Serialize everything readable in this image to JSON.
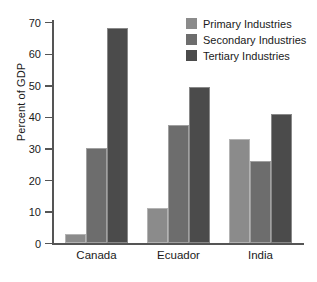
{
  "chart_data": {
    "type": "bar",
    "title": "",
    "xlabel": "",
    "ylabel": "Percent of GDP",
    "ylim": [
      0,
      70
    ],
    "yticks": [
      0,
      10,
      20,
      30,
      40,
      50,
      60,
      70
    ],
    "ytick_labels": [
      "0",
      "10",
      "20",
      "30",
      "40",
      "50",
      "60",
      "70"
    ],
    "grid": false,
    "legend_position": "top-right",
    "categories": [
      "Canada",
      "Ecuador",
      "India"
    ],
    "series": [
      {
        "name": "Primary Industries",
        "color": "#8b8b8b",
        "values": [
          3,
          11,
          33
        ]
      },
      {
        "name": "Secondary Industries",
        "color": "#6d6d6d",
        "values": [
          30,
          37.5,
          26
        ]
      },
      {
        "name": "Tertiary Industries",
        "color": "#4b4b4b",
        "values": [
          68,
          49.5,
          41
        ]
      }
    ]
  }
}
